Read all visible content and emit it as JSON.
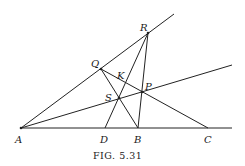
{
  "figure": {
    "caption": "Fig. 5.31",
    "caption_display": "FIG. 5.31"
  },
  "points": {
    "A": {
      "label": "A",
      "x": 21,
      "y": 128
    },
    "B": {
      "label": "B",
      "x": 138,
      "y": 128
    },
    "C": {
      "label": "C",
      "x": 208,
      "y": 128
    },
    "D": {
      "label": "D",
      "x": 105,
      "y": 128
    },
    "P": {
      "label": "P",
      "x": 142,
      "y": 92
    },
    "Q": {
      "label": "Q",
      "x": 101,
      "y": 69
    },
    "R": {
      "label": "R",
      "x": 148,
      "y": 33
    },
    "S": {
      "label": "S",
      "x": 119,
      "y": 98
    },
    "K": {
      "label": "K"
    }
  },
  "lines": [
    {
      "name": "line-A-Q-R",
      "from": "A",
      "through": [
        "Q",
        "R"
      ]
    },
    {
      "name": "line-A-S-P",
      "from": "A",
      "through": [
        "S",
        "P"
      ]
    },
    {
      "name": "line-A-D-B-C",
      "from": "A",
      "through": [
        "D",
        "B",
        "C"
      ]
    },
    {
      "name": "segment-Q-S-B",
      "from": "Q",
      "to": "B"
    },
    {
      "name": "segment-Q-K-P-C",
      "from": "Q",
      "to": "C"
    },
    {
      "name": "segment-R-P-B",
      "from": "R",
      "to": "B"
    },
    {
      "name": "segment-R-K-S-D",
      "from": "R",
      "to": "D"
    }
  ]
}
